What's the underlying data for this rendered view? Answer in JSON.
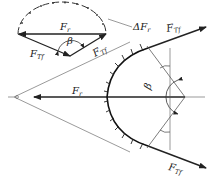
{
  "diagram": {
    "type": "force diagram - belt/rope friction over curved surface",
    "colors": {
      "stroke": "#222222",
      "thin": "#555555",
      "background": "#ffffff"
    },
    "force_polygon": {
      "label_resultant": {
        "main": "F",
        "sub": "r"
      },
      "label_left": {
        "main": "F",
        "sub": "Tf"
      },
      "label_right": {
        "main": "F",
        "sub": "Tf"
      },
      "angle": "β",
      "increment": {
        "main": "ΔF",
        "sub": "r"
      }
    },
    "main_view": {
      "label_resultant": {
        "main": "F",
        "sub": "r"
      },
      "label_top_tension": {
        "main": "F",
        "sub": "Tf"
      },
      "label_bottom_tension": {
        "main": "F",
        "sub": "Tf"
      },
      "angle": "β"
    }
  }
}
